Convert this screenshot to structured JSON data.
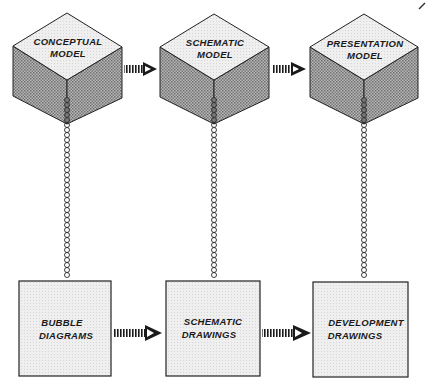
{
  "diagram": {
    "type": "process-flow",
    "colors": {
      "cube_top": "#e8e8e8",
      "cube_side": "#9a9a9a",
      "box_fill": "#ececec",
      "stroke": "#222222",
      "background": "#ffffff"
    },
    "models": [
      {
        "id": "conceptual",
        "line1": "CONCEPTUAL",
        "line2": "MODEL"
      },
      {
        "id": "schematic",
        "line1": "SCHEMATIC",
        "line2": "MODEL"
      },
      {
        "id": "presentation",
        "line1": "PRESENTATION",
        "line2": "MODEL"
      }
    ],
    "drawings": [
      {
        "id": "bubble",
        "line1": "BUBBLE",
        "line2": "DIAGRAMS"
      },
      {
        "id": "schematic",
        "line1": "SCHEMATIC",
        "line2": "DRAWINGS"
      },
      {
        "id": "development",
        "line1": "DEVELOPMENT",
        "line2": "DRAWINGS"
      }
    ],
    "connections": [
      {
        "from": "conceptual-model",
        "to": "schematic-model",
        "style": "hatched-arrow"
      },
      {
        "from": "schematic-model",
        "to": "presentation-model",
        "style": "hatched-arrow"
      },
      {
        "from": "bubble-diagrams",
        "to": "schematic-drawings",
        "style": "hatched-arrow"
      },
      {
        "from": "schematic-drawings",
        "to": "development-drawings",
        "style": "hatched-arrow"
      },
      {
        "from": "conceptual-model",
        "to": "bubble-diagrams",
        "style": "chain-link"
      },
      {
        "from": "schematic-model",
        "to": "schematic-drawings",
        "style": "chain-link"
      },
      {
        "from": "presentation-model",
        "to": "development-drawings",
        "style": "chain-link"
      }
    ]
  }
}
